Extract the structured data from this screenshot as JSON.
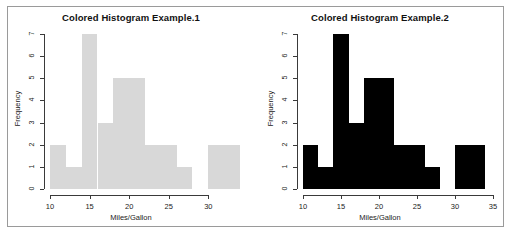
{
  "page": {
    "background_color": "#ffffff",
    "border_color": "#9a9a9a"
  },
  "panels": [
    {
      "id": "example-1",
      "title": "Colored Histogram Example.1",
      "bar_color": "#d8d8d8",
      "bar_border_color": "#d8d8d8",
      "axis_color": "#3a3a3a"
    },
    {
      "id": "example-2",
      "title": "Colored Histogram Example.2",
      "bar_color": "#000000",
      "bar_border_color": "#000000",
      "axis_color": "#3a3a3a"
    }
  ],
  "chart_data": [
    {
      "type": "bar",
      "title": "Colored Histogram Example.1",
      "xlabel": "Miles/Gallon",
      "ylabel": "Frequency",
      "xlim": [
        10,
        34
      ],
      "ylim": [
        0,
        7
      ],
      "xticks": [
        10,
        15,
        20,
        25,
        30
      ],
      "yticks": [
        0,
        1,
        2,
        3,
        4,
        5,
        6,
        7
      ],
      "grid": false,
      "legend": "none",
      "bin_width": 2,
      "bin_edges": [
        10,
        12,
        14,
        16,
        18,
        20,
        22,
        24,
        26,
        28,
        30,
        32,
        34
      ],
      "categories": [
        "10-12",
        "12-14",
        "14-16",
        "16-18",
        "18-20",
        "20-22",
        "22-24",
        "24-26",
        "26-28",
        "28-30",
        "30-32",
        "32-34"
      ],
      "values": [
        2,
        1,
        7,
        3,
        5,
        5,
        2,
        2,
        1,
        0,
        2,
        2
      ],
      "bar_color": "#d8d8d8"
    },
    {
      "type": "bar",
      "title": "Colored Histogram Example.2",
      "xlabel": "Miles/Gallon",
      "ylabel": "Frequency",
      "xlim": [
        10,
        35
      ],
      "ylim": [
        0,
        7
      ],
      "xticks": [
        10,
        15,
        20,
        25,
        30,
        35
      ],
      "yticks": [
        0,
        1,
        2,
        3,
        4,
        5,
        6,
        7
      ],
      "grid": false,
      "legend": "none",
      "bin_width": 2,
      "bin_edges": [
        10,
        12,
        14,
        16,
        18,
        20,
        22,
        24,
        26,
        28,
        30,
        32,
        34
      ],
      "categories": [
        "10-12",
        "12-14",
        "14-16",
        "16-18",
        "18-20",
        "20-22",
        "22-24",
        "24-26",
        "26-28",
        "28-30",
        "30-32",
        "32-34"
      ],
      "values": [
        2,
        1,
        7,
        3,
        5,
        5,
        2,
        2,
        1,
        0,
        2,
        2
      ],
      "bar_color": "#000000"
    }
  ]
}
